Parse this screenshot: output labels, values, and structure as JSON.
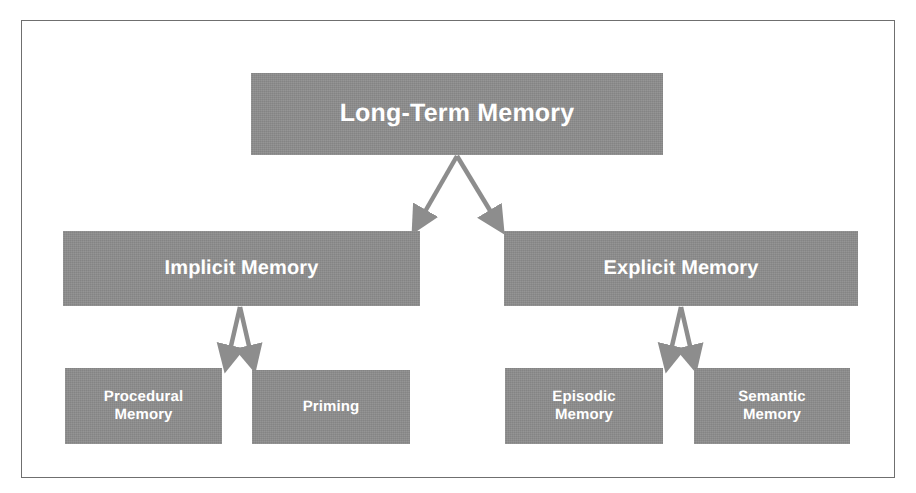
{
  "diagram": {
    "type": "hierarchy-tree",
    "frame": {
      "visible": true,
      "border_color": "#6f6f6f"
    },
    "palette": {
      "box_fill": "#8d8d8d",
      "box_text": "#ffffff",
      "connector": "#8d8d8d",
      "background": "#ffffff"
    },
    "nodes": {
      "root": {
        "label": "Long-Term Memory",
        "level": 1
      },
      "implicit": {
        "label": "Implicit Memory",
        "level": 2
      },
      "explicit": {
        "label": "Explicit Memory",
        "level": 2
      },
      "procedural": {
        "label": "Procedural\nMemory",
        "level": 3
      },
      "priming": {
        "label": "Priming",
        "level": 3
      },
      "episodic": {
        "label": "Episodic\nMemory",
        "level": 3
      },
      "semantic": {
        "label": "Semantic\nMemory",
        "level": 3
      }
    },
    "edges": [
      {
        "from": "root",
        "to": "implicit",
        "style": "arrow"
      },
      {
        "from": "root",
        "to": "explicit",
        "style": "arrow"
      },
      {
        "from": "implicit",
        "to": "procedural",
        "style": "arrow"
      },
      {
        "from": "implicit",
        "to": "priming",
        "style": "arrow"
      },
      {
        "from": "explicit",
        "to": "episodic",
        "style": "arrow"
      },
      {
        "from": "explicit",
        "to": "semantic",
        "style": "arrow"
      }
    ]
  }
}
